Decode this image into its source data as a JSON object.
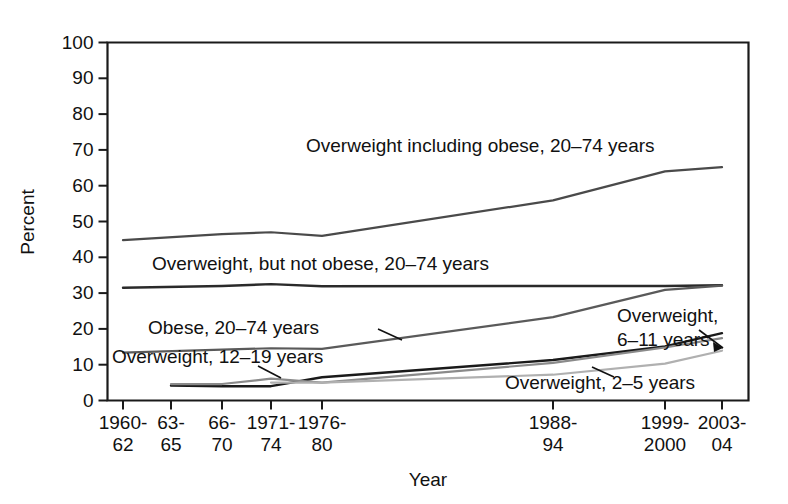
{
  "chart_data": {
    "type": "line",
    "title": "",
    "xlabel": "Year",
    "ylabel": "Percent",
    "ylim": [
      0,
      100
    ],
    "ytick_step": 10,
    "yticks": [
      "0",
      "10",
      "20",
      "30",
      "40",
      "50",
      "60",
      "70",
      "80",
      "90",
      "100"
    ],
    "grid": false,
    "legend_position": "inline-annotations",
    "categories": [
      "1960-62",
      "63-65",
      "66-70",
      "1971-74",
      "1976-80",
      "1988-94",
      "1999-2000",
      "2003-04"
    ],
    "xtick_labels": [
      {
        "line1": "1960-",
        "line2": "62"
      },
      {
        "line1": "63-",
        "line2": "65"
      },
      {
        "line1": "66-",
        "line2": "70"
      },
      {
        "line1": "1971-",
        "line2": "74"
      },
      {
        "line1": "1976-",
        "line2": "80"
      },
      {
        "line1": "1988-",
        "line2": "94"
      },
      {
        "line1": "1999-",
        "line2": "2000"
      },
      {
        "line1": "2003-",
        "line2": "04"
      }
    ],
    "series": [
      {
        "name": "Overweight including obese, 20-74 years",
        "label": "Overweight including obese, 20–74 years",
        "color": "#4a4a4a",
        "width": 2.2,
        "x": [
          "1960-62",
          "66-70",
          "1971-74",
          "1976-80",
          "1988-94",
          "1999-2000",
          "2003-04"
        ],
        "values": [
          44.8,
          46.5,
          47.0,
          46.0,
          55.9,
          64.0,
          65.2
        ]
      },
      {
        "name": "Overweight, but not obese, 20-74 years",
        "label": "Overweight, but not obese, 20–74 years",
        "color": "#2a2a2a",
        "width": 2.4,
        "x": [
          "1960-62",
          "66-70",
          "1971-74",
          "1976-80",
          "1988-94",
          "1999-2000",
          "2003-04"
        ],
        "values": [
          31.5,
          32.0,
          32.5,
          31.9,
          32.0,
          32.0,
          32.2
        ]
      },
      {
        "name": "Obese, 20-74 years",
        "label": "Obese, 20–74 years",
        "color": "#5a5a5a",
        "width": 2.2,
        "x": [
          "1960-62",
          "66-70",
          "1971-74",
          "1976-80",
          "1988-94",
          "1999-2000",
          "2003-04"
        ],
        "values": [
          13.4,
          14.2,
          14.6,
          14.4,
          23.3,
          30.9,
          32.1
        ]
      },
      {
        "name": "Overweight, 6-11 years",
        "label": "Overweight, 6–11 years",
        "color": "#1a1a1a",
        "width": 2.4,
        "x": [
          "63-65",
          "66-70",
          "1971-74",
          "1976-80",
          "1988-94",
          "1999-2000",
          "2003-04"
        ],
        "values": [
          4.2,
          4.0,
          4.0,
          6.5,
          11.3,
          15.1,
          18.8
        ]
      },
      {
        "name": "Overweight, 12-19 years",
        "label": "Overweight, 12–19 years",
        "color": "#8a8a8a",
        "width": 2.2,
        "x": [
          "63-65",
          "66-70",
          "1971-74",
          "1976-80",
          "1988-94",
          "1999-2000",
          "2003-04"
        ],
        "values": [
          4.6,
          4.6,
          6.1,
          5.0,
          10.5,
          14.8,
          17.4
        ]
      },
      {
        "name": "Overweight, 2-5 years",
        "label": "Overweight, 2–5 years",
        "color": "#b0b0b0",
        "width": 2.2,
        "x": [
          "1971-74",
          "1976-80",
          "1988-94",
          "1999-2000",
          "2003-04"
        ],
        "values": [
          5.0,
          5.0,
          7.2,
          10.3,
          13.9
        ]
      }
    ],
    "annotations": [
      {
        "text": "Overweight including obese, 20–74 years",
        "x": 306,
        "y": 152,
        "anchor": "start"
      },
      {
        "text": "Overweight, but not obese, 20–74 years",
        "x": 152,
        "y": 270,
        "anchor": "start"
      },
      {
        "text": "Obese, 20–74 years",
        "x": 148,
        "y": 334,
        "anchor": "start"
      },
      {
        "text": "Overweight, 12–19 years",
        "x": 112,
        "y": 363,
        "anchor": "start"
      },
      {
        "text": "Overweight,",
        "x": 617,
        "y": 322,
        "anchor": "start"
      },
      {
        "text": "6–11 years",
        "x": 617,
        "y": 346,
        "anchor": "start"
      },
      {
        "text": "Overweight, 2–5 years",
        "x": 505,
        "y": 389,
        "anchor": "start"
      }
    ]
  }
}
